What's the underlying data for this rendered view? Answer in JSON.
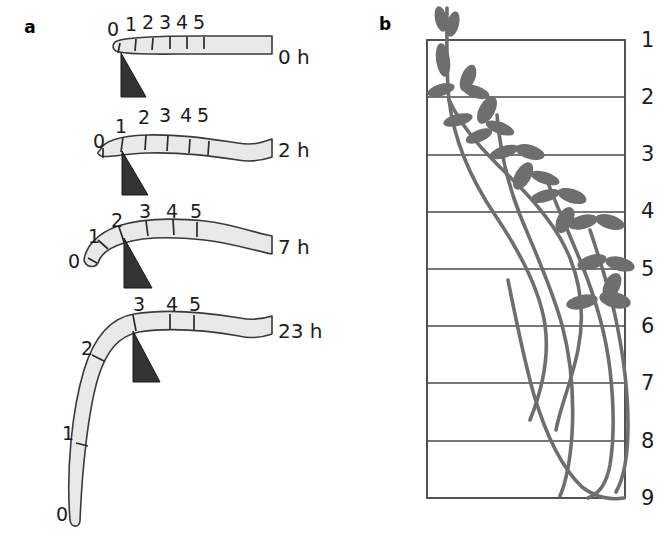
{
  "figure": {
    "panels": [
      {
        "letter": "a",
        "letter_x": 30,
        "letter_y": 33,
        "description": "Time series of a gravistimulated shoot bending upward, marked with position ticks 0-5",
        "time_label_x": 278,
        "stages": [
          {
            "time_label": "0 h",
            "time_label_y": 64,
            "tick_marks": [
              "0",
              "1",
              "2",
              "3",
              "4",
              "5"
            ],
            "tick_label_positions": [
              {
                "label": "0",
                "x": 113,
                "y": 36
              },
              {
                "label": "1",
                "x": 131,
                "y": 31
              },
              {
                "label": "2",
                "x": 148,
                "y": 29
              },
              {
                "label": "3",
                "x": 165,
                "y": 29
              },
              {
                "label": "4",
                "x": 182,
                "y": 29
              },
              {
                "label": "5",
                "x": 199,
                "y": 29
              }
            ],
            "marker_triangle": {
              "x": 125,
              "y": 52
            }
          },
          {
            "time_label": "2 h",
            "time_label_y": 157,
            "tick_marks": [
              "0",
              "1",
              "2",
              "3",
              "4",
              "5"
            ],
            "tick_label_positions": [
              {
                "label": "0",
                "x": 99,
                "y": 148
              },
              {
                "label": "1",
                "x": 121,
                "y": 133
              },
              {
                "label": "2",
                "x": 144,
                "y": 124
              },
              {
                "label": "3",
                "x": 165,
                "y": 122
              },
              {
                "label": "4",
                "x": 186,
                "y": 122
              },
              {
                "label": "5",
                "x": 203,
                "y": 122
              }
            ],
            "marker_triangle": {
              "x": 126,
              "y": 150
            }
          },
          {
            "time_label": "7 h",
            "time_label_y": 254,
            "tick_marks": [
              "0",
              "1",
              "2",
              "3",
              "4",
              "5"
            ],
            "tick_label_positions": [
              {
                "label": "0",
                "x": 74,
                "y": 268
              },
              {
                "label": "1",
                "x": 94,
                "y": 243
              },
              {
                "label": "2",
                "x": 117,
                "y": 227
              },
              {
                "label": "3",
                "x": 145,
                "y": 218
              },
              {
                "label": "4",
                "x": 172,
                "y": 218
              },
              {
                "label": "5",
                "x": 196,
                "y": 218
              }
            ],
            "marker_triangle": {
              "x": 127,
              "y": 242
            }
          },
          {
            "time_label": "23 h",
            "time_label_y": 338,
            "tick_marks": [
              "0",
              "1",
              "2",
              "3",
              "5"
            ],
            "tick_label_positions": [
              {
                "label": "0",
                "x": 62,
                "y": 521
              },
              {
                "label": "1",
                "x": 68,
                "y": 440
              },
              {
                "label": "2",
                "x": 87,
                "y": 355
              },
              {
                "label": "3",
                "x": 139,
                "y": 311
              },
              {
                "label": "4",
                "x": 172,
                "y": 311
              },
              {
                "label": "5",
                "x": 195,
                "y": 311
              }
            ],
            "marker_triangle": {
              "x": 132,
              "y": 335
            }
          }
        ]
      },
      {
        "letter": "b",
        "letter_x": 385,
        "letter_y": 30,
        "description": "Grid box with numbered horizontal reference lines 1-9 and circumnutating leafy shoots",
        "grid": {
          "left": 427,
          "right": 625,
          "top": 40,
          "bottom": 498,
          "line_count": 9,
          "row_labels": [
            "1",
            "2",
            "3",
            "4",
            "5",
            "6",
            "7",
            "8",
            "9"
          ],
          "row_label_x": 641,
          "row_label_y": [
            47,
            104,
            161,
            218,
            276,
            333,
            390,
            448,
            505
          ]
        }
      }
    ],
    "colors": {
      "shoot_fill": "#e9e9e9",
      "shoot_outline": "#3a3a3a",
      "marker_triangle": "#333333",
      "plant_gray": "#6e6e6e",
      "grid_line": "#4a4a4a",
      "background": "#ffffff",
      "text": "#1c1c1c"
    }
  }
}
